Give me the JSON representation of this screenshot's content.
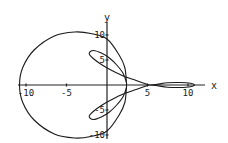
{
  "chart_data": {
    "type": "line",
    "subtype": "parametric/polar curve",
    "title": "",
    "xlabel": "x",
    "ylabel": "y",
    "xlim": [
      -11.5,
      12
    ],
    "ylim": [
      -10.5,
      10.5
    ],
    "grid": false,
    "legend": null,
    "x_ticks": [
      -10,
      -5,
      5,
      10
    ],
    "x_tick_labels": [
      "-10",
      "-5",
      "5",
      "10"
    ],
    "y_ticks": [
      10,
      5,
      -5,
      -10
    ],
    "y_tick_labels": [
      "10",
      "5",
      "-5",
      "-10"
    ],
    "features": {
      "outer_loop": {
        "left_extent": -10.8,
        "top": 10.6,
        "bottom": -10.6,
        "y_axis_crossings": [
          9.2,
          -9.2
        ],
        "right_near_axis": 2.4
      },
      "upper_inner_petal": {
        "tip": [
          -2.2,
          6.3
        ]
      },
      "lower_inner_petal": {
        "tip": [
          -2.2,
          -6.3
        ]
      },
      "cusp_on_x_axis": 5.2,
      "thin_loop_on_x_axis": {
        "from": 6.0,
        "to": 10.8
      }
    },
    "series": [
      {
        "name": "curve",
        "points": [
          [
            5.2,
            0
          ],
          [
            3.6,
            0.9
          ],
          [
            2.0,
            1.8
          ],
          [
            0.6,
            2.9
          ],
          [
            -0.6,
            4.0
          ],
          [
            -1.7,
            5.3
          ],
          [
            -2.2,
            6.3
          ],
          [
            -1.7,
            6.9
          ],
          [
            -0.7,
            6.4
          ],
          [
            0.3,
            5.4
          ],
          [
            1.2,
            4.0
          ],
          [
            2.0,
            2.3
          ],
          [
            2.4,
            0.5
          ],
          [
            2.4,
            0
          ],
          [
            2.4,
            -0.5
          ],
          [
            2.0,
            -2.3
          ],
          [
            1.2,
            -4.0
          ],
          [
            0.3,
            -5.4
          ],
          [
            -0.7,
            -6.4
          ],
          [
            -1.7,
            -6.9
          ],
          [
            -2.2,
            -6.3
          ],
          [
            -1.7,
            -5.3
          ],
          [
            -0.6,
            -4.0
          ],
          [
            0.6,
            -2.9
          ],
          [
            2.0,
            -1.8
          ],
          [
            3.6,
            -0.9
          ],
          [
            5.2,
            0
          ]
        ]
      },
      {
        "name": "outer_loop",
        "points": [
          [
            2.4,
            0.5
          ],
          [
            2.2,
            3.5
          ],
          [
            1.5,
            6.0
          ],
          [
            0.0,
            9.2
          ],
          [
            -2.0,
            10.3
          ],
          [
            -4.0,
            10.6
          ],
          [
            -6.5,
            9.8
          ],
          [
            -9.0,
            7.0
          ],
          [
            -10.4,
            3.5
          ],
          [
            -10.8,
            0
          ],
          [
            -10.4,
            -3.5
          ],
          [
            -9.0,
            -7.0
          ],
          [
            -6.5,
            -9.8
          ],
          [
            -4.0,
            -10.6
          ],
          [
            -2.0,
            -10.3
          ],
          [
            0.0,
            -9.2
          ],
          [
            1.5,
            -6.0
          ],
          [
            2.2,
            -3.5
          ],
          [
            2.4,
            -0.5
          ]
        ]
      },
      {
        "name": "thin_loop",
        "points": [
          [
            5.2,
            0
          ],
          [
            6.0,
            0.1
          ],
          [
            7.5,
            0.45
          ],
          [
            9.0,
            0.5
          ],
          [
            10.3,
            0.35
          ],
          [
            10.8,
            0
          ],
          [
            10.3,
            -0.35
          ],
          [
            9.0,
            -0.5
          ],
          [
            7.5,
            -0.45
          ],
          [
            6.0,
            -0.1
          ],
          [
            5.2,
            0
          ]
        ]
      }
    ]
  }
}
